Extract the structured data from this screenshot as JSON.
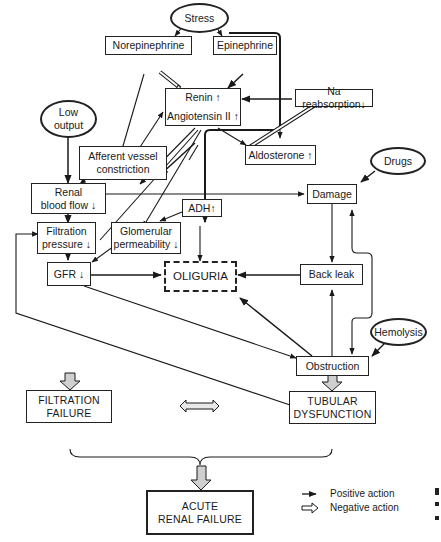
{
  "diagram": {
    "nodes": {
      "stress": "Stress",
      "norepinephrine": "Norepinephrine",
      "epinephrine": "Epinephrine",
      "renin": "Renin ↑",
      "angiotensin": "Angiotensin II ↑",
      "na_reabsorption": "Na reabsorption↓",
      "low_output_1": "Low",
      "low_output_2": "output",
      "afferent_1": "Afferent  vessel",
      "afferent_2": "constriction",
      "aldosterone": "Aldosterone ↑",
      "drugs": "Drugs",
      "renal_bf_1": "Renal",
      "renal_bf_2": "blood flow ↓",
      "damage": "Damage",
      "adh": "ADH↑",
      "filtration_1": "Filtration",
      "filtration_2": "pressure ↓",
      "glomerular_1": "Glomerular",
      "glomerular_2": "permeability ↓",
      "gfr": "GFR ↓",
      "oliguria": "OLIGURIA",
      "back_leak": "Back leak",
      "hemolysis": "Hemolysis",
      "obstruction": "Obstruction",
      "filtration_failure_1": "FILTRATION",
      "filtration_failure_2": "FAILURE",
      "tubular_1": "TUBULAR",
      "tubular_2": "DYSFUNCTION",
      "arf_1": "ACUTE",
      "arf_2": "RENAL FAILURE"
    },
    "legend": {
      "positive": "Positive action",
      "negative": "Negative action"
    },
    "colors": {
      "line": "#1a1a1a",
      "hollow_fill": "#ffffff",
      "block_arrow_fill": "#cfcfcf"
    }
  }
}
